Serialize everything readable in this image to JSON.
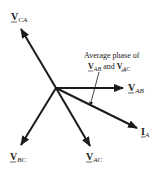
{
  "diagram": {
    "origin": [
      56,
      88
    ],
    "phasors": [
      {
        "id": "v_ca",
        "main": "V",
        "sub": "CA",
        "tip": [
          21,
          29
        ],
        "label_pos": [
          11,
          16
        ]
      },
      {
        "id": "v_ab",
        "main": "V",
        "sub": "AB",
        "tip": [
          123,
          88
        ],
        "label_pos": [
          128,
          93
        ]
      },
      {
        "id": "i_a",
        "main": "I",
        "sub": "A",
        "tip": [
          137,
          128
        ],
        "label_pos": [
          141,
          136
        ]
      },
      {
        "id": "v_ac",
        "main": "V",
        "sub": "AC",
        "tip": [
          90,
          146
        ],
        "label_pos": [
          85,
          162
        ]
      },
      {
        "id": "v_bc",
        "main": "V",
        "sub": "BC",
        "tip": [
          21,
          145
        ],
        "label_pos": [
          10,
          162
        ]
      }
    ],
    "annotation": {
      "line1": "Average phase of",
      "line2_a_main": "V",
      "line2_a_sub": "AB",
      "line2_and": "and",
      "line2_b_main": "V",
      "line2_b_sub": "AC"
    },
    "colors": {
      "stroke": "#1a1a1a",
      "text": "#222222"
    }
  }
}
